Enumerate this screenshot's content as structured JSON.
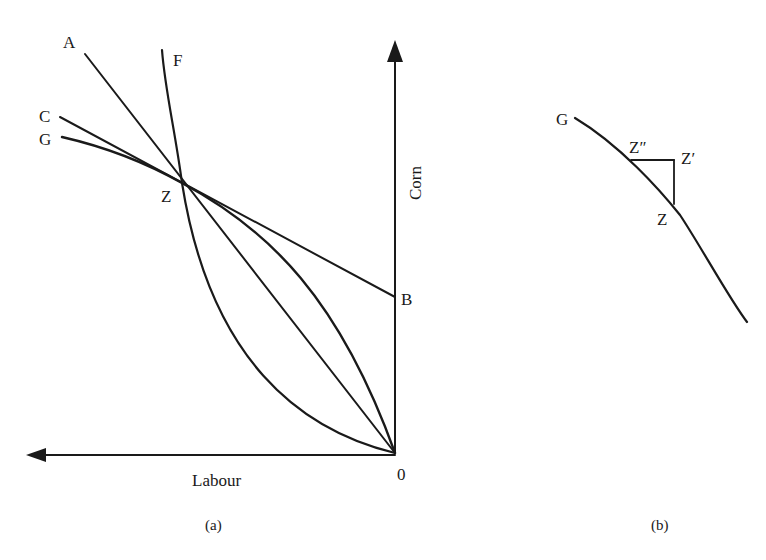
{
  "panel_a": {
    "caption": "(a)",
    "x_axis_label": "Labour",
    "y_axis_label": "Corn",
    "origin_label": "0",
    "labels": {
      "A": "A",
      "F": "F",
      "C": "C",
      "G": "G",
      "Z": "Z",
      "B": "B"
    },
    "curves": [
      {
        "name": "F",
        "type": "convex curve from origin through Z"
      },
      {
        "name": "G",
        "type": "concave curve from origin through Z"
      },
      {
        "name": "A",
        "type": "straight line from origin through Z"
      },
      {
        "name": "C",
        "type": "tangent line to G at Z, meeting Corn axis at B"
      }
    ]
  },
  "panel_b": {
    "caption": "(b)",
    "labels": {
      "G": "G",
      "Z": "Z",
      "Z_prime": "Z′",
      "Z_double_prime": "Z″"
    }
  },
  "colors": {
    "ink": "#1a1a1a",
    "background": "#ffffff"
  }
}
